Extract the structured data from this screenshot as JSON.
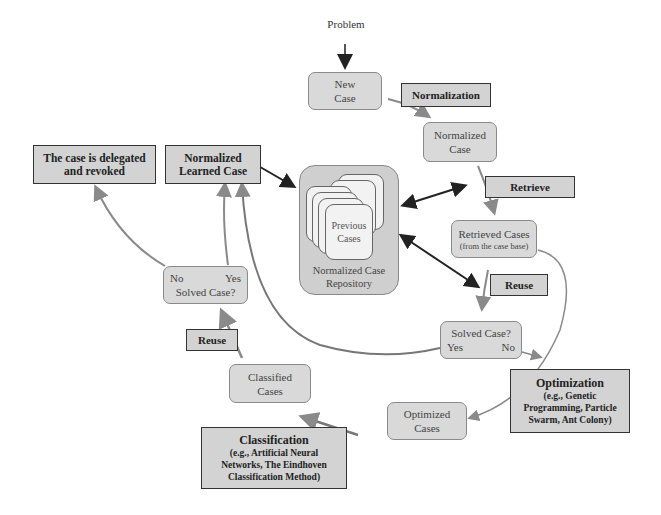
{
  "diagram": {
    "input_label": "Problem",
    "nodes": {
      "new_case": {
        "line1": "New",
        "line2": "Case"
      },
      "normalized_case": {
        "line1": "Normalized",
        "line2": "Case"
      },
      "repository": {
        "inner_line1": "Previous",
        "inner_line2": "Cases",
        "line1": "Normalized Case",
        "line2": "Repository"
      },
      "retrieved_cases": {
        "line1": "Retrieved Cases",
        "line2": "(from the case base)"
      },
      "solved_case_right": {
        "title": "Solved Case?",
        "yes": "Yes",
        "no": "No"
      },
      "optimized_cases": {
        "line1": "Optimized",
        "line2": "Cases"
      },
      "classified_cases": {
        "line1": "Classified",
        "line2": "Cases"
      },
      "solved_case_left": {
        "title": "Solved Case?",
        "no": "No",
        "yes": "Yes"
      },
      "delegated": {
        "line1": "The case is delegated",
        "line2": "and revoked"
      },
      "learned_case": {
        "line1": "Normalized",
        "line2": "Learned Case"
      }
    },
    "process_labels": {
      "normalization": "Normalization",
      "retrieve": "Retrieve",
      "reuse_right": "Reuse",
      "reuse_left": "Reuse",
      "optimization": {
        "title": "Optimization",
        "line1": "(e.g., Genetic",
        "line2": "Programming, Particle",
        "line3": "Swarm, Ant Colony)"
      },
      "classification": {
        "title": "Classification",
        "line1": "(e.g., Artificial Neural",
        "line2": "Networks, The Eindhoven",
        "line3": "Classification Method)"
      }
    },
    "colors": {
      "node_fill": "#d9d9d9",
      "label_fill": "#d3d3d3",
      "arrow_gray": "#8a8a8a",
      "arrow_dark": "#222222"
    }
  }
}
